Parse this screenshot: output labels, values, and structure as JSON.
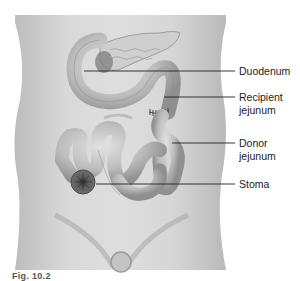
{
  "figure": {
    "type": "anatomical-illustration",
    "palette": {
      "background": "#ffffff",
      "body": "#d2d2d2",
      "body_shadow": "#b5b5b5",
      "organ": "#c9c9c9",
      "organ_dark": "#8e8e8e",
      "stoma": "#5a5a5a",
      "leader_line": "#222222",
      "label_text": "#1c1c1c"
    }
  },
  "labels": [
    {
      "id": "duodenum",
      "lines": [
        "Duodenum"
      ]
    },
    {
      "id": "recipient-jejunum",
      "lines": [
        "Recipient",
        "jejunum"
      ]
    },
    {
      "id": "donor-jejunum",
      "lines": [
        "Donor",
        "jejunum"
      ]
    },
    {
      "id": "stoma",
      "lines": [
        "Stoma"
      ]
    }
  ],
  "caption": {
    "text": "Fig. 10.2"
  }
}
